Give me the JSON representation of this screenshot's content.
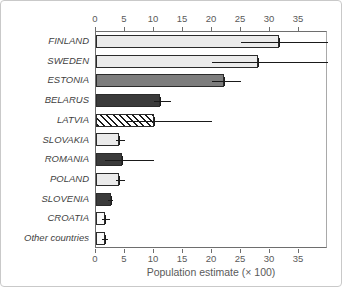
{
  "chart_data": {
    "type": "bar",
    "orientation": "horizontal",
    "title": "",
    "xlabel": "Population estimate (× 100)",
    "xlim": [
      0,
      40
    ],
    "xticks": [
      0,
      5,
      10,
      15,
      20,
      25,
      30,
      35
    ],
    "grid": false,
    "legend": false,
    "categories": [
      "FINLAND",
      "SWEDEN",
      "ESTONIA",
      "BELARUS",
      "LATVIA",
      "SLOVAKIA",
      "ROMANIA",
      "POLAND",
      "SLOVENIA",
      "CROATIA",
      "Other countries"
    ],
    "values": [
      31.5,
      28,
      22,
      11,
      10,
      4,
      4.5,
      4,
      2.5,
      1.5,
      1.5
    ],
    "error_low": [
      25,
      20,
      20,
      10,
      5,
      3.5,
      1.5,
      3.5,
      2,
      1,
      1
    ],
    "error_high": [
      40,
      40,
      25,
      13,
      20,
      5,
      10,
      5,
      3,
      2.5,
      2
    ],
    "bar_styles": [
      "light",
      "light",
      "medium",
      "dark",
      "hatch",
      "light",
      "dark",
      "light",
      "dark",
      "white",
      "white"
    ]
  },
  "colors": {
    "bar_light": "#ebebeb",
    "bar_medium": "#7d7d7d",
    "bar_dark": "#3b3b3b",
    "bar_white": "#fafafa",
    "bar_border": "#2b2b2b",
    "hatch_line": "#1a1a1a",
    "axis": "#6e6e6e",
    "error_bar": "#1a1a1a",
    "label_text": "#3f3f3f",
    "tick_text": "#5a5a5a",
    "background": "#ffffff"
  }
}
